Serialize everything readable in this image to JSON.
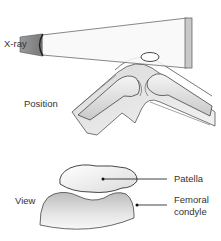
{
  "diagram": {
    "panels": [
      {
        "id": "position",
        "label": "Position"
      },
      {
        "id": "view",
        "label": "View"
      }
    ],
    "labels": {
      "xray": "X-ray",
      "position": "Position",
      "view": "View",
      "patella": "Patella",
      "femoral_condyle_line1": "Femoral",
      "femoral_condyle_line2": "condyle"
    },
    "colors": {
      "outline": "#3a3a3a",
      "bone_fill": "#ececec",
      "shadow": "#b5b5b5",
      "beam": "#f7f7f7",
      "plate": "#c8c8c8",
      "tube": "#8e8e8e"
    }
  }
}
